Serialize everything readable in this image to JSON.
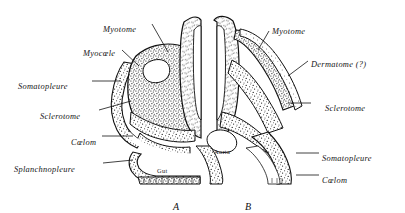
{
  "figure": {
    "background_color": "#ffffff",
    "ink_color": "#111111",
    "width": 405,
    "height": 213
  },
  "panels": [
    {
      "id": "A",
      "label": "A",
      "x": 173,
      "y": 201
    },
    {
      "id": "B",
      "label": "B",
      "x": 245,
      "y": 201
    }
  ],
  "labels_left": [
    {
      "name": "myotome",
      "text": "Myotome",
      "x": 103,
      "y": 26,
      "align": "start"
    },
    {
      "name": "myocoele",
      "text": "Myocœle",
      "x": 83,
      "y": 50,
      "align": "start"
    },
    {
      "name": "somatopleure",
      "text": "Somatopleure",
      "x": 18,
      "y": 83,
      "align": "start"
    },
    {
      "name": "sclerotome",
      "text": "Sclerotome",
      "x": 40,
      "y": 113,
      "align": "start"
    },
    {
      "name": "coelom",
      "text": "Cœlom",
      "x": 71,
      "y": 139,
      "align": "start"
    },
    {
      "name": "splanchnopleure",
      "text": "Splanchnopleure",
      "x": 14,
      "y": 166,
      "align": "start"
    }
  ],
  "labels_right": [
    {
      "name": "myotome",
      "text": "Myotome",
      "x": 272,
      "y": 28,
      "align": "start"
    },
    {
      "name": "dermatome",
      "text": "Dermatome (?)",
      "x": 311,
      "y": 61,
      "align": "start"
    },
    {
      "name": "sclerotome",
      "text": "Sclerotome",
      "x": 325,
      "y": 105,
      "align": "start"
    },
    {
      "name": "somatopleure",
      "text": "Somatopleure",
      "x": 322,
      "y": 155,
      "align": "start"
    },
    {
      "name": "coelom",
      "text": "Cœlom",
      "x": 322,
      "y": 177,
      "align": "start"
    }
  ],
  "inner_labels": [
    {
      "name": "gut",
      "text": "Gut",
      "x": 157,
      "y": 167
    },
    {
      "name": "aorta",
      "text": "Aorta",
      "x": 214,
      "y": 148
    }
  ],
  "leaders": [
    {
      "name": "leader-myotome-left",
      "x1": 152,
      "y1": 24,
      "x2": 168,
      "y2": 52
    },
    {
      "name": "leader-myocoele-left",
      "x1": 122,
      "y1": 50,
      "x2": 139,
      "y2": 66
    },
    {
      "name": "leader-somatopleure-left",
      "x1": 92,
      "y1": 81,
      "x2": 121,
      "y2": 81
    },
    {
      "name": "leader-sclerotome-left",
      "x1": 99,
      "y1": 110,
      "x2": 131,
      "y2": 101
    },
    {
      "name": "leader-coelom-left",
      "x1": 102,
      "y1": 136,
      "x2": 133,
      "y2": 136
    },
    {
      "name": "leader-splanchnopleure-left",
      "x1": 103,
      "y1": 163,
      "x2": 133,
      "y2": 160
    },
    {
      "name": "leader-myotome-right",
      "x1": 269,
      "y1": 31,
      "x2": 258,
      "y2": 50
    },
    {
      "name": "leader-dermatome-right",
      "x1": 308,
      "y1": 61,
      "x2": 288,
      "y2": 76
    },
    {
      "name": "leader-sclerotome-right",
      "x1": 311,
      "y1": 103,
      "x2": 288,
      "y2": 103
    },
    {
      "name": "leader-somatopleure-right",
      "x1": 319,
      "y1": 153,
      "x2": 296,
      "y2": 153
    },
    {
      "name": "leader-coelom-right",
      "x1": 319,
      "y1": 175,
      "x2": 296,
      "y2": 175
    }
  ]
}
